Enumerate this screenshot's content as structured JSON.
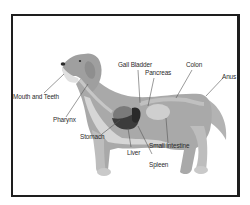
{
  "diagram": {
    "labels": {
      "mouth_and_teeth": "Mouth and Teeth",
      "pharynx": "Pharynx",
      "stomach": "Stomach",
      "liver": "Liver",
      "gall_bladder": "Gall Bladder",
      "pancreas": "Pancreas",
      "colon": "Colon",
      "anus": "Anus",
      "small_intestine": "Small Intestine",
      "spleen": "Spleen"
    },
    "colors": {
      "border": "#1e1e1e",
      "fur": "#a9a9a9",
      "fur_light": "#d2d2d2",
      "organ_dark": "#3c3c3c",
      "organ_mid": "#7a7a7a",
      "leader_line": "#555555",
      "text": "#2a2a2a"
    }
  }
}
